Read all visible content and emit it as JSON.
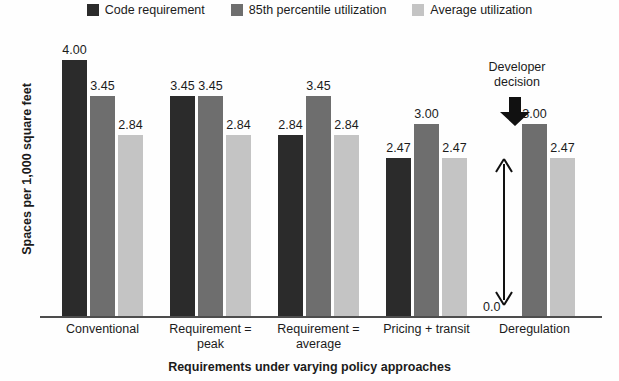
{
  "legend": {
    "entries": [
      {
        "label": "Code requirement",
        "color": "#2b2b2b",
        "icon": "legend-swatch-icon"
      },
      {
        "label": "85th percentile utilization",
        "color": "#6e6e6e",
        "icon": "legend-swatch-icon"
      },
      {
        "label": "Average utilization",
        "color": "#c4c4c4",
        "icon": "legend-swatch-icon"
      }
    ]
  },
  "annotation": {
    "title_line1": "Developer",
    "title_line2": "decision",
    "down_arrow_icon": "down-arrow-icon",
    "range_arrow_icon": "double-headed-vertical-arrow-icon",
    "zero_label": "0.0"
  },
  "chart_data": {
    "type": "bar",
    "title": "",
    "xlabel": "Requirements under varying policy approaches",
    "ylabel": "Spaces per 1,000 square feet",
    "categories": [
      "Conventional",
      "Requirement =\npeak",
      "Requirement =\naverage",
      "Pricing + transit",
      "Deregulation"
    ],
    "category_lines": [
      [
        "Conventional"
      ],
      [
        "Requirement =",
        "peak"
      ],
      [
        "Requirement =",
        "average"
      ],
      [
        "Pricing + transit"
      ],
      [
        "Deregulation"
      ]
    ],
    "series": [
      {
        "name": "Code requirement",
        "color": "#2b2b2b",
        "values": [
          4.0,
          3.45,
          2.84,
          2.47,
          null
        ],
        "labels": [
          "4.00",
          "3.45",
          "2.84",
          "2.47",
          ""
        ]
      },
      {
        "name": "85th percentile utilization",
        "color": "#6e6e6e",
        "values": [
          3.45,
          3.45,
          3.45,
          3.0,
          3.0
        ],
        "labels": [
          "3.45",
          "3.45",
          "3.45",
          "3.00",
          "3.00"
        ]
      },
      {
        "name": "Average utilization",
        "color": "#c4c4c4",
        "values": [
          2.84,
          2.84,
          2.84,
          2.47,
          2.47
        ],
        "labels": [
          "2.84",
          "2.84",
          "2.84",
          "2.47",
          "2.47"
        ]
      }
    ],
    "ylim": [
      0,
      4.35
    ],
    "grid": false,
    "legend_position": "top-center",
    "yticks_visible": false
  }
}
